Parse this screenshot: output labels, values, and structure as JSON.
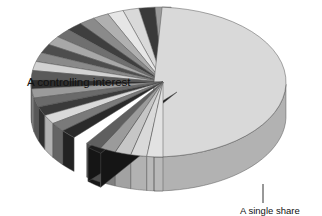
{
  "figure": {
    "background_color": "#ffffff",
    "labels": {
      "controlling_interest": "A controlling interest",
      "single_share": "A single share"
    }
  },
  "chart_data": {
    "type": "pie",
    "title": "",
    "subtitle": "",
    "xlabel": "",
    "ylabel": "",
    "legend": [],
    "annotations": [
      {
        "name": "controlling-interest-label",
        "text": "A controlling interest",
        "target_slice": "A controlling interest",
        "placement": "inside-left"
      },
      {
        "name": "single-share-callout",
        "text": "A single share",
        "target_slice": "A single share",
        "placement": "below-right",
        "has_leader_line": true
      }
    ],
    "style": {
      "three_d": true,
      "depth_px": 34,
      "start_angle_deg": 90,
      "direction": "clockwise",
      "exploded_slices": [
        "A controlling interest",
        "A single share"
      ],
      "grid": false,
      "legend_position": "none"
    },
    "palette": {
      "light": "#d9d9d9",
      "light_2": "#e6e6e6",
      "mid": "#9b9b9b",
      "mid_2": "#8a8a8a",
      "dark": "#4d4d4d",
      "darker": "#3a3a3a",
      "near_black": "#1c1c1c",
      "side_shade_factor": 0.82,
      "outline": "#555555"
    },
    "categories": [
      "A controlling interest",
      "Share 1",
      "Share 2",
      "Share 3",
      "Share 4",
      "Share 5",
      "Share 6",
      "Share 7",
      "Share 8",
      "Share 9",
      "Share 10",
      "Share 11",
      "Share 12",
      "Share 13",
      "Share 14",
      "Share 15",
      "Share 16",
      "Share 17",
      "Share 18",
      "Share 19",
      "Share 20",
      "A single share",
      "Share 22",
      "Share 23",
      "Share 24",
      "Share 25",
      "Share 26"
    ],
    "values": [
      50.0,
      2.0,
      2.0,
      2.0,
      2.0,
      2.0,
      2.0,
      2.0,
      2.0,
      2.0,
      2.0,
      2.0,
      2.0,
      2.0,
      2.0,
      2.0,
      2.0,
      2.0,
      2.0,
      2.0,
      2.0,
      2.0,
      2.0,
      2.0,
      2.0,
      2.0,
      2.0
    ],
    "colors": [
      "#d9d9d9",
      "#9b9b9b",
      "#3a3a3a",
      "#d9d9d9",
      "#e6e6e6",
      "#b0b0b0",
      "#8a8a8a",
      "#3f3f3f",
      "#6f6f6f",
      "#a8a8a8",
      "#4d4d4d",
      "#8a8a8a",
      "#d2d2d2",
      "#5a5a5a",
      "#2f2f2f",
      "#9b9b9b",
      "#6a6a6a",
      "#3a3a3a",
      "#d9d9d9",
      "#7a7a7a",
      "#2a2a2a",
      "#1c1c1c",
      "#5f5f5f",
      "#9b9b9b",
      "#c6c6c6",
      "#d9d9d9",
      "#e2e2e2"
    ],
    "units": "percent",
    "total": 100
  }
}
